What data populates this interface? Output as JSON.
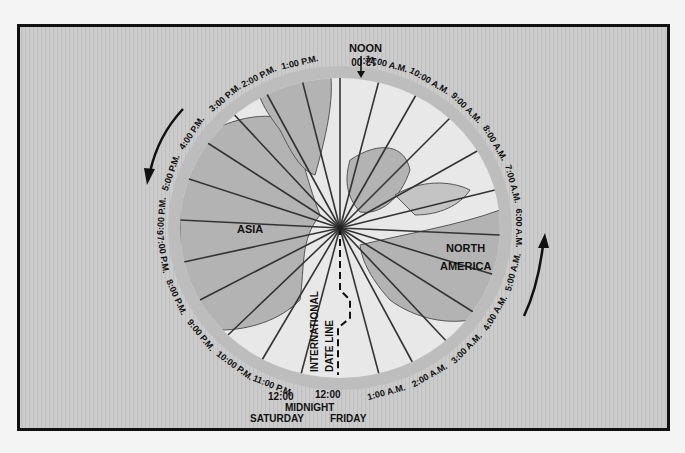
{
  "diagram": {
    "type": "polar world time zone diagram",
    "center_label": "North Pole",
    "continents": [
      {
        "name": "ASIA",
        "position": "left"
      },
      {
        "name": "NORTH AMERICA",
        "position": "right"
      }
    ],
    "top_label": "NOON",
    "date_line": {
      "label_1": "INTERNATIONAL",
      "label_2": "DATE LINE",
      "left_day": "SATURDAY",
      "right_day": "FRIDAY",
      "midnight_label": "MIDNIGHT"
    },
    "time_ring": [
      {
        "time": "12:00",
        "suffix": "",
        "angle": 0,
        "note": "Noon"
      },
      {
        "time": "11:00",
        "suffix": "A.M.",
        "angle": 15
      },
      {
        "time": "10:00",
        "suffix": "A.M.",
        "angle": 30
      },
      {
        "time": "9:00",
        "suffix": "A.M.",
        "angle": 45
      },
      {
        "time": "8:00",
        "suffix": "A.M.",
        "angle": 60
      },
      {
        "time": "7:00",
        "suffix": "A.M.",
        "angle": 75
      },
      {
        "time": "6:00",
        "suffix": "A.M.",
        "angle": 90
      },
      {
        "time": "5:00",
        "suffix": "A.M.",
        "angle": 105
      },
      {
        "time": "4:00",
        "suffix": "A.M.",
        "angle": 120
      },
      {
        "time": "3:00",
        "suffix": "A.M.",
        "angle": 135
      },
      {
        "time": "2:00",
        "suffix": "A.M.",
        "angle": 150
      },
      {
        "time": "1:00",
        "suffix": "A.M.",
        "angle": 165
      },
      {
        "time": "12:00",
        "suffix": "",
        "angle": 178,
        "note": "Midnight Friday"
      },
      {
        "time": "12:00",
        "suffix": "",
        "angle": 188,
        "note": "Midnight Saturday"
      },
      {
        "time": "11:00",
        "suffix": "P.M.",
        "angle": 202
      },
      {
        "time": "10:00",
        "suffix": "P.M.",
        "angle": 216
      },
      {
        "time": "9:00",
        "suffix": "P.M.",
        "angle": 231
      },
      {
        "time": "8:00",
        "suffix": "P.M.",
        "angle": 246
      },
      {
        "time": "7:00",
        "suffix": "P.M.",
        "angle": 261
      },
      {
        "time": "6:00",
        "suffix": "P.M.",
        "angle": 274
      },
      {
        "time": "5:00",
        "suffix": "P.M.",
        "angle": 289
      },
      {
        "time": "4:00",
        "suffix": "P.M.",
        "angle": 304
      },
      {
        "time": "3:00",
        "suffix": "P.M.",
        "angle": 320
      },
      {
        "time": "2:00",
        "suffix": "P.M.",
        "angle": 333
      },
      {
        "time": "1:00",
        "suffix": "P.M.",
        "angle": 347
      }
    ],
    "arrows": [
      {
        "side": "left",
        "direction": "counter-clockwise (downward)"
      },
      {
        "side": "right",
        "direction": "counter-clockwise (upward)"
      }
    ],
    "colors": {
      "background": "#c9c9c9",
      "disc": "#e6e6e6",
      "land": "#b5b5b5",
      "ring": "#bdbdbd",
      "ink": "#111111"
    }
  }
}
